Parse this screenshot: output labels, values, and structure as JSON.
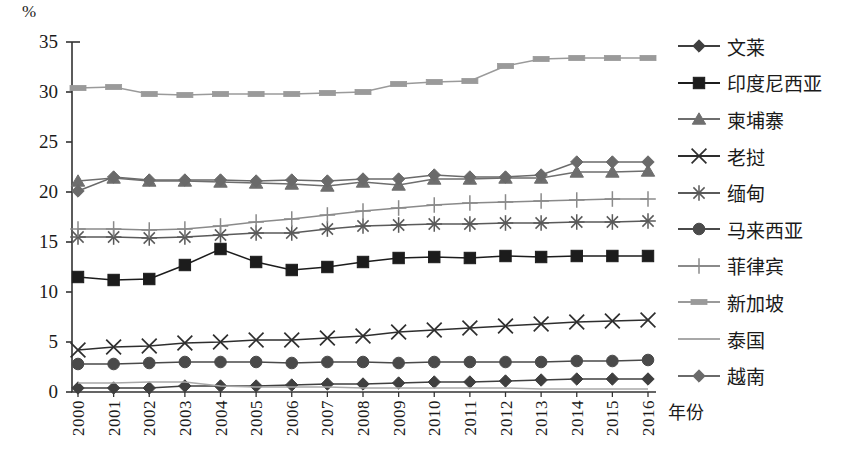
{
  "chart_data": {
    "type": "line",
    "title": "",
    "xlabel": "年份",
    "ylabel": "%",
    "ylim": [
      0,
      35
    ],
    "yticks": [
      0,
      5,
      10,
      15,
      20,
      25,
      30,
      35
    ],
    "grid": false,
    "legend_position": "right",
    "x": [
      "2000",
      "2001",
      "2002",
      "2003",
      "2004",
      "2005",
      "2006",
      "2007",
      "2008",
      "2009",
      "2010",
      "2011",
      "2012",
      "2013",
      "2014",
      "2015",
      "2016"
    ],
    "categories": [
      "2000",
      "2001",
      "2002",
      "2003",
      "2004",
      "2005",
      "2006",
      "2007",
      "2008",
      "2009",
      "2010",
      "2011",
      "2012",
      "2013",
      "2014",
      "2015",
      "2016"
    ],
    "series": [
      {
        "name": "文莱",
        "marker": "diamond",
        "color": "#3f3f3f",
        "values": [
          0.4,
          0.4,
          0.4,
          0.6,
          0.6,
          0.6,
          0.7,
          0.8,
          0.8,
          0.9,
          1.0,
          1.0,
          1.1,
          1.2,
          1.3,
          1.3,
          1.3
        ]
      },
      {
        "name": "印度尼西亚",
        "marker": "square",
        "color": "#1c1c1c",
        "values": [
          11.5,
          11.2,
          11.3,
          12.7,
          14.3,
          13.0,
          12.2,
          12.5,
          13.0,
          13.4,
          13.5,
          13.4,
          13.6,
          13.5,
          13.6,
          13.6,
          13.6
        ]
      },
      {
        "name": "柬埔寨",
        "marker": "triangle",
        "color": "#6e6e6e",
        "values": [
          21.1,
          21.4,
          21.1,
          21.1,
          21.0,
          20.9,
          20.8,
          20.6,
          21.0,
          20.7,
          21.3,
          21.3,
          21.4,
          21.4,
          22.0,
          22.0,
          22.1
        ]
      },
      {
        "name": "老挝",
        "marker": "x",
        "color": "#2e2e2e",
        "values": [
          4.2,
          4.5,
          4.6,
          4.9,
          5.0,
          5.2,
          5.2,
          5.4,
          5.6,
          6.0,
          6.2,
          6.4,
          6.6,
          6.8,
          7.0,
          7.1,
          7.2
        ]
      },
      {
        "name": "缅甸",
        "marker": "asterisk",
        "color": "#5a5a5a",
        "values": [
          15.5,
          15.5,
          15.4,
          15.5,
          15.7,
          15.9,
          15.9,
          16.3,
          16.6,
          16.7,
          16.8,
          16.8,
          16.9,
          16.9,
          17.0,
          17.0,
          17.1
        ]
      },
      {
        "name": "马来西亚",
        "marker": "circle",
        "color": "#4a4a4a",
        "values": [
          2.8,
          2.8,
          2.9,
          3.0,
          3.0,
          3.0,
          2.9,
          3.0,
          3.0,
          2.9,
          3.0,
          3.0,
          3.0,
          3.0,
          3.1,
          3.1,
          3.2
        ]
      },
      {
        "name": "菲律宾",
        "marker": "plus",
        "color": "#8a8a8a",
        "values": [
          16.3,
          16.3,
          16.2,
          16.3,
          16.6,
          17.0,
          17.3,
          17.7,
          18.1,
          18.4,
          18.7,
          18.9,
          19.0,
          19.1,
          19.2,
          19.3,
          19.3
        ]
      },
      {
        "name": "新加坡",
        "marker": "rect",
        "color": "#9a9a9a",
        "values": [
          30.4,
          30.5,
          29.8,
          29.7,
          29.8,
          29.8,
          29.8,
          29.9,
          30.0,
          30.8,
          31.0,
          31.1,
          32.6,
          33.3,
          33.4,
          33.4,
          33.4
        ]
      },
      {
        "name": "泰国",
        "marker": "none",
        "color": "#a8a8a8",
        "values": [
          0.9,
          0.9,
          1.0,
          1.0,
          0.6,
          0.5,
          0.5,
          0.5,
          0.4,
          0.4,
          0.4,
          0.4,
          0.4,
          0.3,
          0.3,
          0.3,
          0.3
        ]
      },
      {
        "name": "越南",
        "marker": "diamond",
        "color": "#6a6a6a",
        "values": [
          20.1,
          21.5,
          21.2,
          21.2,
          21.2,
          21.1,
          21.2,
          21.1,
          21.3,
          21.3,
          21.7,
          21.5,
          21.5,
          21.7,
          23.0,
          23.0,
          23.0
        ]
      }
    ]
  },
  "legend": {
    "items": [
      {
        "label": "文莱",
        "marker": "diamond",
        "color": "#3f3f3f"
      },
      {
        "label": "印度尼西亚",
        "marker": "square",
        "color": "#1c1c1c"
      },
      {
        "label": "柬埔寨",
        "marker": "triangle",
        "color": "#6e6e6e"
      },
      {
        "label": "老挝",
        "marker": "x",
        "color": "#2e2e2e"
      },
      {
        "label": "缅甸",
        "marker": "asterisk",
        "color": "#5a5a5a"
      },
      {
        "label": "马来西亚",
        "marker": "circle",
        "color": "#4a4a4a"
      },
      {
        "label": "菲律宾",
        "marker": "plus",
        "color": "#8a8a8a"
      },
      {
        "label": "新加坡",
        "marker": "rect",
        "color": "#9a9a9a"
      },
      {
        "label": "泰国",
        "marker": "none",
        "color": "#a8a8a8"
      },
      {
        "label": "越南",
        "marker": "diamond",
        "color": "#6a6a6a"
      }
    ]
  }
}
